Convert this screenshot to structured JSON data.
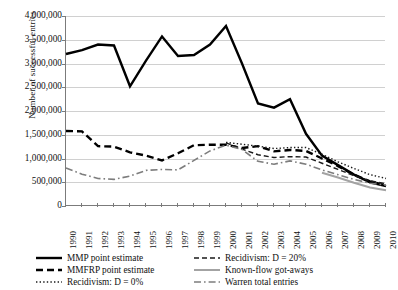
{
  "chart_data": {
    "type": "line",
    "title": "",
    "xlabel": "",
    "ylabel": "Number of successful entries",
    "x": [
      1990,
      1991,
      1992,
      1993,
      1994,
      1995,
      1996,
      1997,
      1998,
      1999,
      2000,
      2001,
      2002,
      2003,
      2004,
      2005,
      2006,
      2007,
      2008,
      2009,
      2010
    ],
    "xtick_labels": [
      "1990",
      "1991",
      "1992",
      "1993",
      "1994",
      "1995",
      "1996",
      "1997",
      "1998",
      "1999",
      "2000",
      "2001",
      "2002",
      "2003",
      "2004",
      "2005",
      "2006",
      "2007",
      "2008",
      "2009",
      "2010"
    ],
    "ylim": [
      0,
      4000000
    ],
    "ytick_values": [
      0,
      500000,
      1000000,
      1500000,
      2000000,
      2500000,
      3000000,
      3500000,
      4000000
    ],
    "ytick_labels": [
      "0",
      "500,000",
      "1,000,000",
      "1,500,000",
      "2,000,000",
      "2,500,000",
      "3,000,000",
      "3,500,000",
      "4,000,000"
    ],
    "grid": true,
    "legend_position": "below-plot",
    "series": [
      {
        "name": "MMP point estimate",
        "style": "solid-thick-black",
        "color": "#000000",
        "x": [
          1990,
          1991,
          1992,
          1993,
          1994,
          1995,
          1996,
          1997,
          1998,
          1999,
          2000,
          2001,
          2002,
          2003,
          2004,
          2005,
          2006,
          2007,
          2008,
          2009,
          2010
        ],
        "values": [
          3200000,
          3280000,
          3400000,
          3380000,
          2520000,
          3060000,
          3570000,
          3160000,
          3180000,
          3400000,
          3790000,
          3000000,
          2160000,
          2070000,
          2250000,
          1520000,
          1060000,
          860000,
          660000,
          500000,
          420000
        ]
      },
      {
        "name": "MMFRP point estimate",
        "style": "dashed-thick-black",
        "color": "#000000",
        "x": [
          1990,
          1991,
          1992,
          1993,
          1994,
          1995,
          1996,
          1997,
          1998,
          1999,
          2000,
          2001,
          2002,
          2003,
          2004,
          2005,
          2006,
          2007,
          2008,
          2009,
          2010
        ],
        "values": [
          1580000,
          1570000,
          1260000,
          1250000,
          1130000,
          1060000,
          960000,
          1110000,
          1280000,
          1290000,
          1290000,
          1220000,
          1260000,
          1150000,
          1180000,
          1160000,
          1000000,
          840000,
          660000,
          520000,
          430000
        ]
      },
      {
        "name": "Recidivism: D = 20%",
        "style": "dashed-fine-black",
        "color": "#000000",
        "x": [
          2000,
          2001,
          2002,
          2003,
          2004,
          2005,
          2006,
          2007,
          2008,
          2009,
          2010
        ],
        "values": [
          1330000,
          1200000,
          1080000,
          1020000,
          1040000,
          1030000,
          900000,
          770000,
          640000,
          530000,
          470000
        ]
      },
      {
        "name": "Recidivism: D = 0%",
        "style": "dotted-black",
        "color": "#000000",
        "x": [
          2000,
          2001,
          2002,
          2003,
          2004,
          2005,
          2006,
          2007,
          2008,
          2009,
          2010
        ],
        "values": [
          1340000,
          1300000,
          1260000,
          1210000,
          1230000,
          1230000,
          1090000,
          930000,
          790000,
          660000,
          580000
        ]
      },
      {
        "name": "Warren total entries",
        "style": "dash-dot-gray",
        "color": "#808080",
        "x": [
          1990,
          1991,
          1992,
          1993,
          1994,
          1995,
          1996,
          1997,
          1998,
          1999,
          2000,
          2001,
          2002,
          2003,
          2004,
          2005,
          2006,
          2007,
          2008,
          2009,
          2010
        ],
        "values": [
          800000,
          670000,
          580000,
          560000,
          630000,
          750000,
          770000,
          760000,
          960000,
          1160000,
          1280000,
          1190000,
          940000,
          880000,
          950000,
          880000,
          760000,
          660000,
          560000,
          480000,
          440000
        ]
      },
      {
        "name": "Known-flow got-aways",
        "style": "solid-gray",
        "color": "#9a9a9a",
        "x": [
          2006,
          2007,
          2008,
          2009,
          2010
        ],
        "values": [
          700000,
          600000,
          490000,
          390000,
          330000
        ]
      }
    ]
  },
  "legend": {
    "items": [
      {
        "label": "MMP point estimate",
        "swatch": "solid-thick-black"
      },
      {
        "label": "Recidivism: D = 20%",
        "swatch": "dashed-fine-black"
      },
      {
        "label": "MMFRP point estimate",
        "swatch": "dashed-thick-black"
      },
      {
        "label": "Known-flow got-aways",
        "swatch": "solid-gray"
      },
      {
        "label": "Recidivism: D = 0%",
        "swatch": "dotted-black"
      },
      {
        "label": "Warren total entries",
        "swatch": "dash-dot-gray"
      }
    ]
  }
}
